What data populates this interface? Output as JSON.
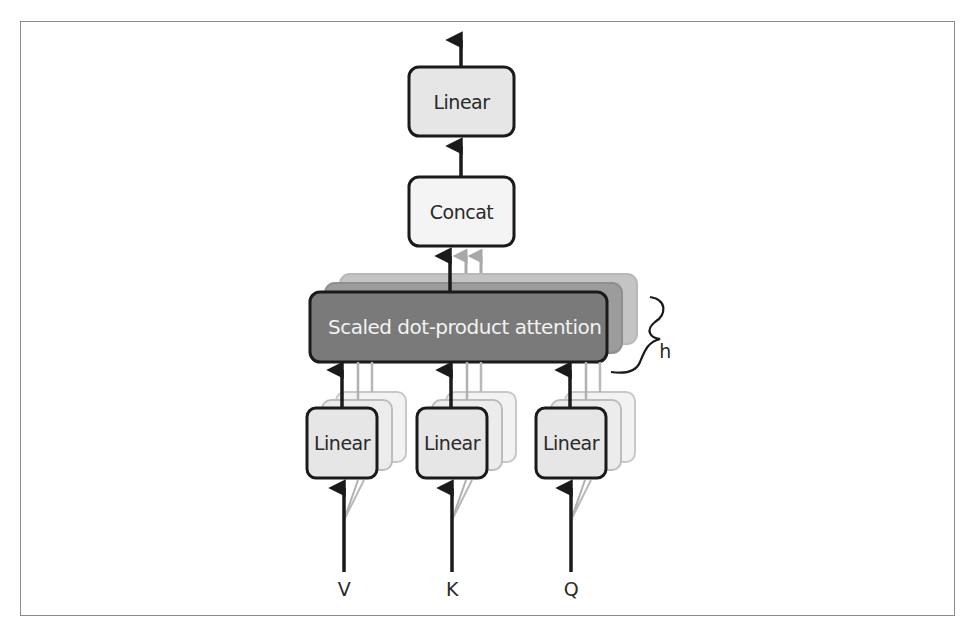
{
  "diagram": {
    "output_linear": {
      "label": "Linear"
    },
    "concat": {
      "label": "Concat"
    },
    "attention": {
      "label": "Scaled dot-product attention"
    },
    "heads_label": "h",
    "projections": [
      {
        "label": "Linear",
        "input": "V"
      },
      {
        "label": "Linear",
        "input": "K"
      },
      {
        "label": "Linear",
        "input": "Q"
      }
    ],
    "colors": {
      "box_fill": "#e6e6e6",
      "concat_fill": "#f4f4f4",
      "attention_fill": "#7a7a7a",
      "attention_shadow_1": "#9c9c9c",
      "attention_shadow_2": "#c4c4c4",
      "stroke": "#1a1a1a",
      "ghost_stroke": "#b0b0b0"
    }
  }
}
